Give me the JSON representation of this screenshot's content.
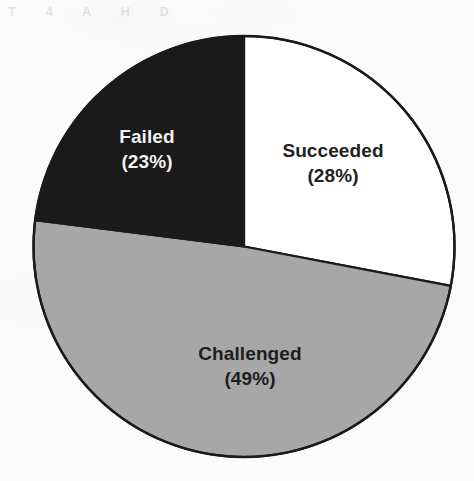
{
  "figure": {
    "background_color": "#fbfbfb",
    "outline_color": "#1a1a1a",
    "ghost_artifact_text": "T 4 A H D"
  },
  "labels": {
    "succeeded": {
      "name": "Succeeded",
      "percent_text": "(28%)"
    },
    "failed": {
      "name": "Failed",
      "percent_text": "(23%)"
    },
    "challenged": {
      "name": "Challenged",
      "percent_text": "(49%)"
    }
  },
  "chart_data": {
    "type": "pie",
    "title": "",
    "subtitle": "",
    "xlabel": "",
    "ylabel": "",
    "categories": [
      "Succeeded",
      "Challenged",
      "Failed"
    ],
    "values": [
      28,
      49,
      23
    ],
    "value_unit": "percent",
    "total": 100,
    "start_angle_deg": 0,
    "direction": "clockwise",
    "legend": "none",
    "grid": false,
    "data_labels": true,
    "data_label_format": "{name}\n({value}%)",
    "slices": [
      {
        "name": "Succeeded",
        "value": 28,
        "label": "Succeeded",
        "percent_text": "(28%)",
        "color": "#ffffff",
        "text_color": "#222222",
        "start_angle_deg": 0,
        "end_angle_deg": 100.8
      },
      {
        "name": "Challenged",
        "value": 49,
        "label": "Challenged",
        "percent_text": "(49%)",
        "color": "#a7a7a7",
        "text_color": "#1d1d1d",
        "start_angle_deg": 100.8,
        "end_angle_deg": 277.2
      },
      {
        "name": "Failed",
        "value": 23,
        "label": "Failed",
        "percent_text": "(23%)",
        "color": "#1a1a1a",
        "text_color": "#f2f2f2",
        "start_angle_deg": 277.2,
        "end_angle_deg": 360
      }
    ]
  }
}
